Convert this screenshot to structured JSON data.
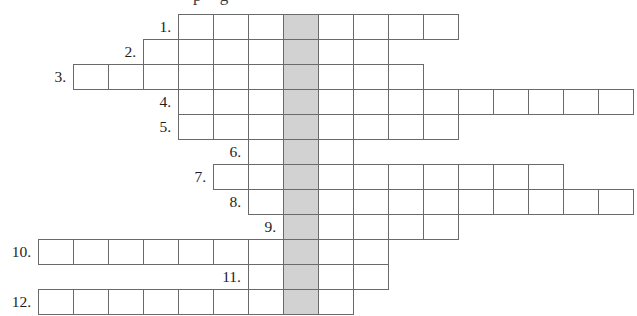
{
  "page": {
    "artifact_text": "p g",
    "background_color": "#ffffff"
  },
  "grid": {
    "type": "crossword-with-key-column",
    "cell_width": 35,
    "cell_height": 25,
    "origin_x": 3,
    "origin_y": 14,
    "line_color": "#6a6a6a",
    "shaded_color": "#d2d2d2",
    "cell_color": "#ffffff",
    "shaded_column": 8,
    "rows": [
      {
        "label": "1.",
        "start_col": 5,
        "length": 8
      },
      {
        "label": "2.",
        "start_col": 4,
        "length": 7
      },
      {
        "label": "3.",
        "start_col": 2,
        "length": 10
      },
      {
        "label": "4.",
        "start_col": 5,
        "length": 13
      },
      {
        "label": "5.",
        "start_col": 5,
        "length": 8
      },
      {
        "label": "6.",
        "start_col": 7,
        "length": 3
      },
      {
        "label": "7.",
        "start_col": 6,
        "length": 10
      },
      {
        "label": "8.",
        "start_col": 7,
        "length": 11
      },
      {
        "label": "9.",
        "start_col": 8,
        "length": 5
      },
      {
        "label": "10.",
        "start_col": 1,
        "length": 10
      },
      {
        "label": "11.",
        "start_col": 7,
        "length": 4
      },
      {
        "label": "12.",
        "start_col": 1,
        "length": 9
      }
    ]
  }
}
